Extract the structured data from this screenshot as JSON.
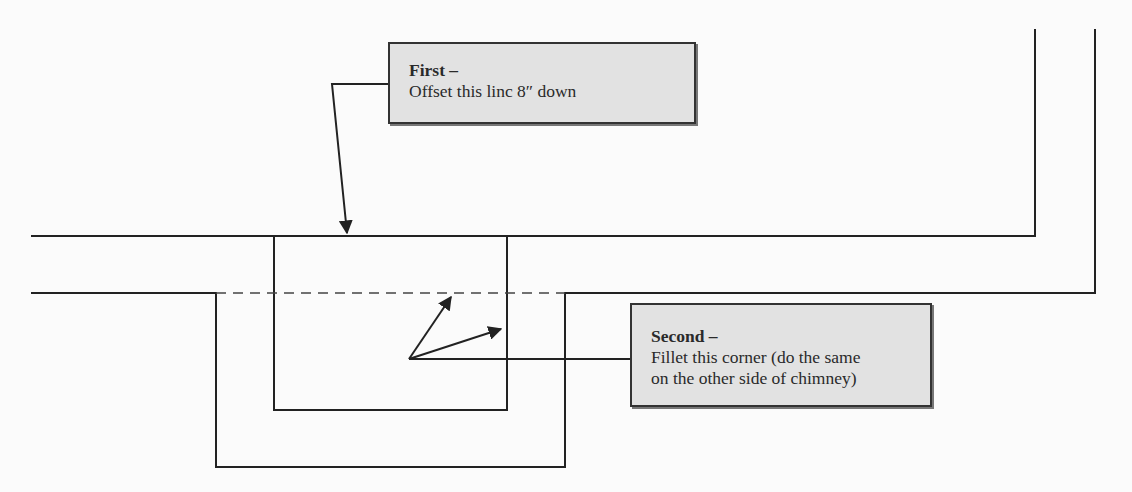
{
  "diagram": {
    "type": "cad-plan-annotation",
    "colors": {
      "line": "#222222",
      "callout_fill": "#e2e2e2",
      "background": "#fbfbfb"
    },
    "callouts": [
      {
        "id": "first",
        "title": "First –",
        "lines": [
          "Offset this linc 8″ down"
        ]
      },
      {
        "id": "second",
        "title": "Second –",
        "lines": [
          "Fillet this corner (do the same",
          "on the other side of chimney)"
        ]
      }
    ],
    "labels": {
      "wall_top_line": "wall line (top)",
      "wall_offset_line": "offset wall line",
      "chimney_inner": "chimney inner outline",
      "chimney_outer": "chimney outer outline"
    }
  }
}
